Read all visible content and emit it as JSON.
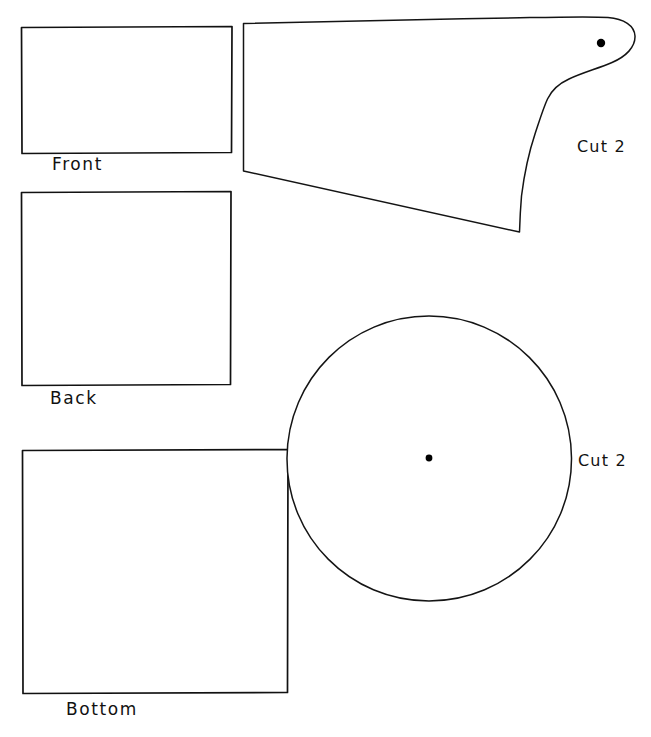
{
  "sheet": {
    "width": 651,
    "height": 737,
    "background_color": "#ffffff",
    "ink_color": "#111111",
    "description": "Hand-drawn sewing pattern sheet with five pattern pieces"
  },
  "pieces": [
    {
      "id": "front",
      "label": "Front",
      "shape": "rectangle",
      "label_x": 52,
      "label_y": 156,
      "geometry": {
        "x": 21,
        "y": 27,
        "width": 211,
        "height": 126
      }
    },
    {
      "id": "back",
      "label": "Back",
      "shape": "square",
      "label_x": 50,
      "label_y": 390,
      "geometry": {
        "x": 21,
        "y": 192,
        "width": 210,
        "height": 193
      }
    },
    {
      "id": "bottom",
      "label": "Bottom",
      "shape": "square",
      "label_x": 66,
      "label_y": 701,
      "geometry": {
        "x": 22,
        "y": 450,
        "width": 266,
        "height": 243
      }
    },
    {
      "id": "side-profile",
      "label": "Cut 2",
      "shape": "profile",
      "label_x": 577,
      "label_y": 139,
      "has_mark_dot": true,
      "mark_dot": {
        "x": 601,
        "y": 43,
        "r": 4
      }
    },
    {
      "id": "circle",
      "label": "Cut 2",
      "shape": "circle",
      "label_x": 578,
      "label_y": 453,
      "has_mark_dot": true,
      "mark_dot": {
        "x": 429,
        "y": 458,
        "r": 3
      },
      "geometry": {
        "cx": 429,
        "cy": 458,
        "r": 142
      }
    }
  ]
}
